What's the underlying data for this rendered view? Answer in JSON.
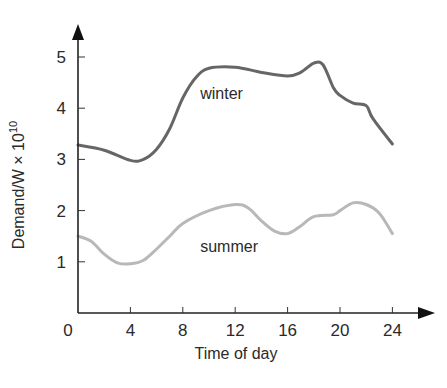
{
  "chart_data": {
    "type": "line",
    "title": "",
    "xlabel": "Time of day",
    "ylabel": "Demand/W × 10",
    "ylabel_exponent": "10",
    "xlim": [
      0,
      24
    ],
    "ylim": [
      0,
      5.5
    ],
    "xticks": [
      0,
      4,
      8,
      12,
      16,
      20,
      24
    ],
    "yticks": [
      1,
      2,
      3,
      4,
      5
    ],
    "xtick_labels": [
      "0",
      "4",
      "8",
      "12",
      "16",
      "20",
      "24"
    ],
    "ytick_labels": [
      "1",
      "2",
      "3",
      "4",
      "5"
    ],
    "grid": false,
    "legend": "inline labels",
    "series": [
      {
        "name": "winter",
        "color": "#666666",
        "label_pos": [
          12,
          4.3
        ],
        "x": [
          0,
          2,
          4,
          5,
          6,
          7,
          8,
          9,
          10,
          12,
          14,
          16,
          17,
          18,
          18.7,
          19.5,
          20,
          21,
          22,
          22.5,
          24
        ],
        "values": [
          3.28,
          3.18,
          2.98,
          3.0,
          3.2,
          3.6,
          4.2,
          4.6,
          4.78,
          4.8,
          4.7,
          4.63,
          4.7,
          4.88,
          4.85,
          4.4,
          4.25,
          4.1,
          4.05,
          3.8,
          3.3
        ]
      },
      {
        "name": "summer",
        "color": "#b8b8b8",
        "label_pos": [
          12,
          1.3
        ],
        "x": [
          0,
          1,
          2,
          3,
          4,
          5,
          6,
          7,
          8,
          10,
          12,
          13,
          14,
          15,
          16,
          17,
          18,
          19.5,
          20,
          21,
          22,
          23,
          24
        ],
        "values": [
          1.5,
          1.4,
          1.15,
          0.98,
          0.96,
          1.03,
          1.25,
          1.5,
          1.75,
          2.0,
          2.12,
          2.05,
          1.8,
          1.6,
          1.55,
          1.7,
          1.88,
          1.92,
          2.0,
          2.15,
          2.12,
          1.95,
          1.55
        ]
      }
    ]
  }
}
